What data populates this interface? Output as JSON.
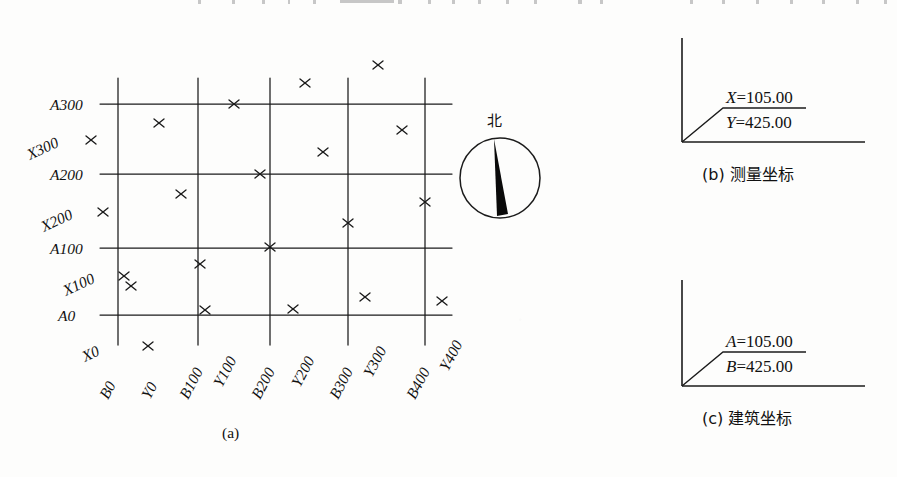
{
  "figure": {
    "background_color": "#fdfdfc",
    "ink_color": "#111111",
    "panel_a_caption": "(a)",
    "panel_b_caption": "(b) 测量坐标",
    "panel_c_caption": "(c) 建筑坐标"
  },
  "panel_a": {
    "name": "grid-plan",
    "compass": {
      "label": "北",
      "needle_direction": "north-up-slightly-left"
    },
    "building_coord_rows": [
      {
        "label": "A300"
      },
      {
        "label": "A200"
      },
      {
        "label": "A100"
      },
      {
        "label": "A0"
      }
    ],
    "building_coord_cols": [
      {
        "label": "B0"
      },
      {
        "label": "B100"
      },
      {
        "label": "B200"
      },
      {
        "label": "B300"
      },
      {
        "label": "B400"
      }
    ],
    "survey_coord_rows": [
      {
        "label": "X300"
      },
      {
        "label": "X200"
      },
      {
        "label": "X100"
      }
    ],
    "survey_coord_cols": [
      {
        "label": "Y0"
      },
      {
        "label": "Y100"
      },
      {
        "label": "Y200"
      },
      {
        "label": "Y300"
      },
      {
        "label": "Y400"
      }
    ],
    "survey_origin_col": {
      "label": "X0"
    },
    "grid_markers_symbol": "cross-tick",
    "grid_marker_count": 23
  },
  "panel_b": {
    "name": "survey-coordinate-callout",
    "caption": "(b) 测量坐标",
    "line_1_symbol": "X",
    "line_1_value": "105.00",
    "line_1_text": "X=105.00",
    "line_2_symbol": "Y",
    "line_2_value": "425.00",
    "line_2_text": "Y=425.00"
  },
  "panel_c": {
    "name": "building-coordinate-callout",
    "caption": "(c) 建筑坐标",
    "line_1_symbol": "A",
    "line_1_value": "105.00",
    "line_1_text": "A=105.00",
    "line_2_symbol": "B",
    "line_2_value": "425.00",
    "line_2_text": "B=425.00"
  }
}
